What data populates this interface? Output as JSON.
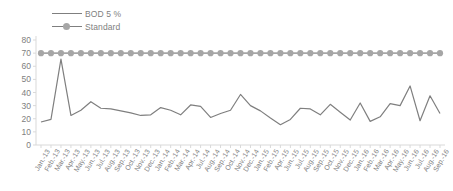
{
  "chart_data": {
    "type": "line",
    "title": "",
    "xlabel": "",
    "ylabel": "",
    "ylim": [
      0,
      80
    ],
    "ytick_step": 10,
    "yticks": [
      80,
      70,
      60,
      50,
      40,
      30,
      20,
      10,
      0
    ],
    "grid": false,
    "legend_position": "top-left",
    "categories": [
      "Jan.-13",
      "Feb.-13",
      "Mar.-13",
      "Apr.-13",
      "May.-13",
      "Jun.-13",
      "Jul.-13",
      "Aug.-13",
      "Sep.-13",
      "Oct.-13",
      "Nov.-13",
      "Dec.-13",
      "Jan.-14",
      "Feb.-14",
      "Mar.-14",
      "Apr.-14",
      "Jul.-14",
      "Aug.-14",
      "Sep.-14",
      "Oct.-14",
      "Nov.-14",
      "Dec.-14",
      "Jan.-15",
      "Feb.-15",
      "Apr.-15",
      "Jun.-15",
      "Jul.-15",
      "Aug.-15",
      "Sep.-15",
      "Oct.-15",
      "Nov.-15",
      "Dec.-15",
      "Jan.-16",
      "Feb.-16",
      "Mar.-16",
      "Apr.-16",
      "May.-16",
      "Jun.-16",
      "Jul.-16",
      "Aug.-16",
      "Sep.-16"
    ],
    "series": [
      {
        "name": "BOD 5  %",
        "color": "#7f7f7f",
        "marker": "none",
        "values": [
          17.5,
          19.5,
          65.5,
          22.5,
          26.5,
          33.0,
          28.0,
          27.5,
          26.0,
          24.5,
          22.5,
          23.0,
          28.5,
          26.5,
          23.0,
          30.5,
          29.5,
          21.0,
          24.0,
          26.5,
          38.5,
          30.0,
          26.0,
          20.5,
          15.5,
          19.5,
          28.0,
          27.5,
          23.0,
          31.0,
          25.0,
          19.0,
          32.0,
          18.0,
          21.5,
          31.5,
          30.0,
          45.0,
          18.5,
          37.5,
          24.0
        ]
      },
      {
        "name": "Standard",
        "color": "#a6a6a6",
        "marker": "circle",
        "values": [
          70,
          70,
          70,
          70,
          70,
          70,
          70,
          70,
          70,
          70,
          70,
          70,
          70,
          70,
          70,
          70,
          70,
          70,
          70,
          70,
          70,
          70,
          70,
          70,
          70,
          70,
          70,
          70,
          70,
          70,
          70,
          70,
          70,
          70,
          70,
          70,
          70,
          70,
          70,
          70,
          70
        ]
      }
    ]
  },
  "legend": {
    "entries": [
      {
        "label": "BOD 5  %"
      },
      {
        "label": "Standard"
      }
    ]
  },
  "colors": {
    "bod_line": "#7f7f7f",
    "standard_line": "#a6a6a6",
    "axis": "#d9d9d9",
    "text": "#808080",
    "background": "#ffffff"
  }
}
